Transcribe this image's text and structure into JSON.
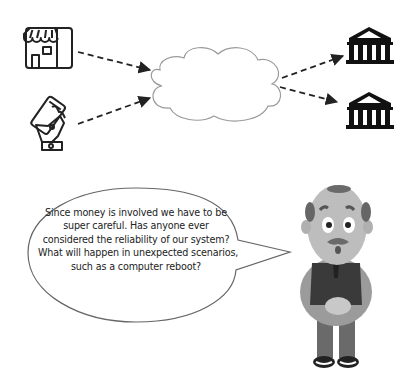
{
  "diagram": {
    "sources": [
      {
        "id": "store",
        "icon": "storefront-icon",
        "label": ""
      },
      {
        "id": "mobile",
        "icon": "mobile-payment-icon",
        "label": ""
      }
    ],
    "hub": {
      "id": "cloud",
      "icon": "cloud-shape",
      "label": ""
    },
    "targets": [
      {
        "id": "bank-1",
        "icon": "bank-icon",
        "label": ""
      },
      {
        "id": "bank-2",
        "icon": "bank-icon",
        "label": ""
      }
    ],
    "edges": [
      {
        "from": "store",
        "to": "cloud",
        "style": "dashed-arrow"
      },
      {
        "from": "mobile",
        "to": "cloud",
        "style": "dashed-arrow"
      },
      {
        "from": "cloud",
        "to": "bank-1",
        "style": "dashed-arrow"
      },
      {
        "from": "cloud",
        "to": "bank-2",
        "style": "dashed-arrow"
      }
    ]
  },
  "speech_bubble": {
    "speaker": "bald-man-character",
    "lines": [
      "Since money is involved we have to be",
      "super careful. Has anyone ever",
      "considered the reliability of our system?",
      "What will happen in unexpected scenarios,",
      "such as a computer reboot?"
    ]
  },
  "colors": {
    "stroke": "#222222",
    "cloud_stroke": "#9a9a9a",
    "bubble_stroke": "#666666",
    "character_skin": "#bdbdbd",
    "character_vest": "#3a3a3a",
    "character_shirt": "#9b9b9b",
    "character_pants": "#6a6a6a"
  }
}
